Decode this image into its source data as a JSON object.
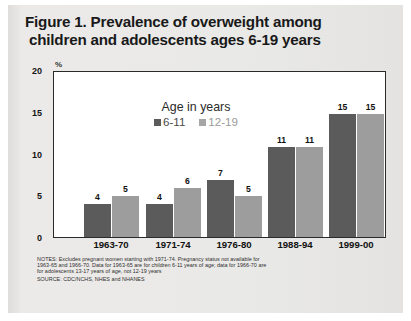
{
  "title": {
    "line1": "Figure 1. Prevalence of overweight among",
    "line2": "children and adolescents ages 6-19 years"
  },
  "axis": {
    "percent_symbol": "%"
  },
  "legend": {
    "title": "Age in years",
    "series": [
      {
        "label": "6-11",
        "color": "#5b5b5b"
      },
      {
        "label": "12-19",
        "color": "#a6a6a6"
      }
    ]
  },
  "footnotes": {
    "notes_line1": "NOTES: Excludes pregnant women starting with 1971-74.  Pregnancy status not available for",
    "notes_line2": "1963-65 and 1966-70. Data for 1963-65 are for children 6-11 years of age; data for 1966-70 are",
    "notes_line3": "for adolescents 13-17 years of age, not 12-19 years",
    "source_line": "SOURCE: CDC/NCHS, NHES and NHANES"
  },
  "chart_data": {
    "type": "bar",
    "title": "Figure 1. Prevalence of overweight among children and adolescents ages 6-19 years",
    "xlabel": "",
    "ylabel": "%",
    "ylim": [
      0,
      20
    ],
    "yticks": [
      0,
      5,
      10,
      15,
      20
    ],
    "grid": false,
    "legend_position": "inside-top-center",
    "categories": [
      "1963-70",
      "1971-74",
      "1976-80",
      "1988-94",
      "1999-00"
    ],
    "series": [
      {
        "name": "6-11",
        "color": "#5b5b5b",
        "values": [
          4,
          4,
          7,
          11,
          15
        ]
      },
      {
        "name": "12-19",
        "color": "#9d9d9d",
        "values": [
          5,
          6,
          5,
          11,
          15
        ]
      }
    ],
    "data_labels": true,
    "annotations": [
      "NOTES: Excludes pregnant women starting with 1971-74.  Pregnancy status not available for 1963-65 and 1966-70. Data for 1963-65 are for children 6-11 years of age; data for 1966-70 are for adolescents 13-17 years of age, not 12-19 years",
      "SOURCE: CDC/NCHS, NHES and NHANES"
    ]
  }
}
